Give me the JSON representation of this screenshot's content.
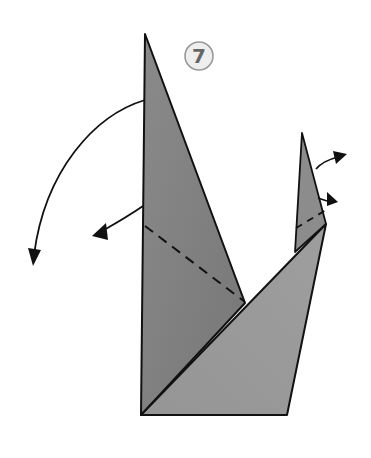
{
  "diagram": {
    "type": "origami-instruction",
    "step_label": "7",
    "colors": {
      "paper_dark": "#7f7f7f",
      "paper_mid": "#8c8c8c",
      "paper_light": "#999999",
      "outline": "#111111",
      "step_circle_fill": "#eeeeee",
      "step_circle_stroke": "#999999",
      "step_text": "#666666"
    },
    "elements": [
      {
        "name": "tall-left-flap",
        "kind": "polygon"
      },
      {
        "name": "front-triangle-flap",
        "kind": "polygon"
      },
      {
        "name": "small-right-point",
        "kind": "polygon"
      },
      {
        "name": "left-fold-line",
        "kind": "dashed-line"
      },
      {
        "name": "right-fold-line",
        "kind": "dashed-line"
      },
      {
        "name": "large-rotate-arrow",
        "kind": "arrow"
      },
      {
        "name": "left-fold-arrow",
        "kind": "arrow"
      },
      {
        "name": "right-upper-arrow",
        "kind": "arrow"
      },
      {
        "name": "right-lower-arrow",
        "kind": "arrow"
      }
    ]
  }
}
